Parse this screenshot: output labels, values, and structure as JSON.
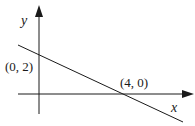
{
  "diagram": {
    "axes": {
      "x_label": "x",
      "y_label": "y"
    },
    "points": [
      {
        "label": "(0, 2)",
        "x": 0,
        "y": 2
      },
      {
        "label": "(4, 0)",
        "x": 4,
        "y": 0
      }
    ],
    "line": {
      "description": "straight line with negative slope through (0, 2) and (4, 0)"
    },
    "colors": {
      "stroke": "#1a1a1a",
      "background": "#ffffff"
    }
  }
}
